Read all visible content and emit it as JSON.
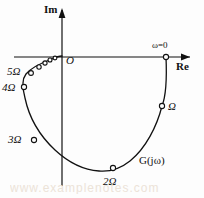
{
  "figure": {
    "background_color": "#fdfdfd",
    "stroke_color": "#111111",
    "watermark_text": "www.examplenotes.com"
  },
  "axes": {
    "imaginary_label": "Im",
    "real_label": "Re",
    "origin_label": "O",
    "origin_px": {
      "x": 62,
      "y": 57
    },
    "x_axis_y_px": 57,
    "y_axis_x_px": 62
  },
  "annotations": {
    "start_label": "ω=0",
    "curve_label": "G(jω)"
  },
  "chart_data": {
    "type": "line",
    "xlabel": "Re",
    "ylabel": "Im",
    "grid": false,
    "legend": null,
    "origin_label": "O",
    "curve_label": "G(jω)",
    "start_annotation": "ω=0",
    "markers": [
      {
        "label": "ω=0",
        "x_px": 166,
        "y_px": 57,
        "marker": true
      },
      {
        "label": "Ω",
        "x_px": 162,
        "y_px": 106,
        "marker": true
      },
      {
        "label": "2Ω",
        "x_px": 113,
        "y_px": 168,
        "marker": true
      },
      {
        "label": "3Ω",
        "x_px": 34,
        "y_px": 140,
        "marker": true
      },
      {
        "label": "4Ω",
        "x_px": 24,
        "y_px": 87,
        "marker": true
      },
      {
        "label": "5Ω",
        "x_px": 31,
        "y_px": 73,
        "marker": true
      },
      {
        "label": "",
        "x_px": 39,
        "y_px": 67,
        "marker": true
      },
      {
        "label": "",
        "x_px": 45,
        "y_px": 63,
        "marker": true
      },
      {
        "label": "",
        "x_px": 50,
        "y_px": 60,
        "marker": true
      },
      {
        "label": "",
        "x_px": 55,
        "y_px": 58,
        "marker": true
      }
    ],
    "curve_path_px": "M166,57 C167,80 166,96 162,106 C157,126 146,148 130,161 C120,169 110,172 99,171 C84,170 69,163 55,150 C40,136 29,117 25,98 C22,87 22,79 26,74 C31,68 41,63 52,59 C56,57 60,56 62,56"
  }
}
